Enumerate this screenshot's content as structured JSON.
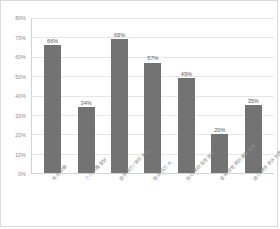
{
  "chart_data": {
    "type": "bar",
    "title": "",
    "xlabel": "",
    "ylabel": "",
    "ylim": [
      0,
      80
    ],
    "grid": true,
    "legend": false,
    "legend_position": "none",
    "y_ticks": [
      "0%",
      "10%",
      "20%",
      "30%",
      "40%",
      "50%",
      "60%",
      "70%",
      "80%"
    ],
    "y_tick_values": [
      0,
      10,
      20,
      30,
      40,
      50,
      60,
      70,
      80
    ],
    "categories": [
      "专业前景",
      "个人兴趣爱好",
      "自身能力/学历水平",
      "就业压力大",
      "担心考研失败就业",
      "家长及老师的期望影响",
      "自己想多学点东西"
    ],
    "values": [
      66,
      34,
      69,
      57,
      49,
      20,
      35
    ],
    "data_labels": [
      "66%",
      "34%",
      "69%",
      "57%",
      "49%",
      "20%",
      "35%"
    ],
    "bar_color": "#737373",
    "grid_color": "#e6e6e6",
    "axis_color": "#d4d4d4",
    "text_color": "#8a8a8a",
    "background": "#ffffff"
  }
}
